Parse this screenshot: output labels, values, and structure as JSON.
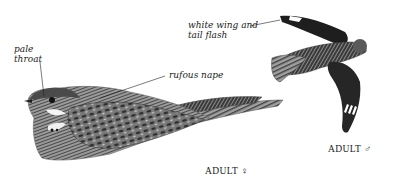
{
  "figure": {
    "background_color": "#ffffff",
    "ink_color": "#1c1c1c",
    "annotations": [
      {
        "id": "pale-throat",
        "line1": "pale",
        "line2": "throat"
      },
      {
        "id": "rufous-nape",
        "line1": "rufous nape"
      },
      {
        "id": "white-wing-tail-flash",
        "line1": "white wing and",
        "line2": "tail flash"
      }
    ],
    "captions": {
      "female": "ADULT ♀",
      "male": "ADULT ♂"
    }
  }
}
